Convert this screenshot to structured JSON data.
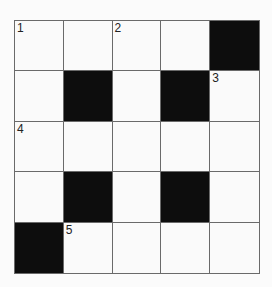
{
  "puzzle": {
    "rows": 5,
    "cols": 5,
    "colors": {
      "block": "#0d0d0d",
      "cell": "#fafafa",
      "line": "#6a6a6a"
    },
    "grid": [
      [
        {
          "n": "1"
        },
        {},
        {
          "n": "2"
        },
        {},
        {
          "b": true
        }
      ],
      [
        {},
        {
          "b": true
        },
        {},
        {
          "b": true
        },
        {
          "n": "3"
        }
      ],
      [
        {
          "n": "4"
        },
        {},
        {},
        {},
        {}
      ],
      [
        {},
        {
          "b": true
        },
        {},
        {
          "b": true
        },
        {}
      ],
      [
        {
          "b": true
        },
        {
          "n": "5"
        },
        {},
        {},
        {}
      ]
    ]
  }
}
